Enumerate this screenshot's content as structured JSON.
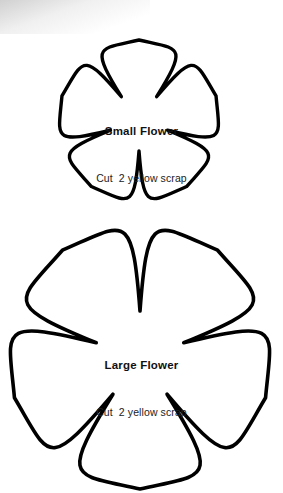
{
  "page": {
    "background_color": "#ffffff",
    "ink_color": "#000000",
    "width": 283,
    "height": 493
  },
  "templates": [
    {
      "id": "small-flower",
      "name": "Small Flower",
      "instruction": "Cut  2 yellow scrap",
      "petal_count": 5,
      "orientation": "one-petal-up"
    },
    {
      "id": "large-flower",
      "name": "Large Flower",
      "instruction": "Cut  2 yellow scrap",
      "petal_count": 5,
      "orientation": "one-petal-down"
    }
  ],
  "icons": {
    "flower_outline": "flower-outline-icon"
  }
}
